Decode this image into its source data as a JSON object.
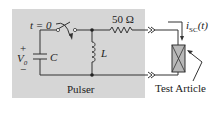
{
  "diagram": {
    "type": "circuit-schematic",
    "colors": {
      "background": "#ffffff",
      "pulser_box": "#d6d6d6",
      "wire": "#333333",
      "test_article_fill": "#b8b8b8"
    },
    "labels": {
      "switch_time": "t = 0",
      "resistor": "50 Ω",
      "voltage_plus": "+",
      "voltage": "V",
      "voltage_sub": "0",
      "voltage_minus": "−",
      "capacitor": "C",
      "inductor": "L",
      "current": "i",
      "current_sub": "SC",
      "current_arg": "(t)",
      "pulser": "Pulser",
      "test_article": "Test Article"
    },
    "components": [
      {
        "id": "C",
        "kind": "capacitor"
      },
      {
        "id": "switch",
        "kind": "switch",
        "closes_at": "t = 0"
      },
      {
        "id": "L",
        "kind": "inductor"
      },
      {
        "id": "R",
        "kind": "resistor",
        "value": "50 Ω"
      },
      {
        "id": "DUT",
        "kind": "test-article"
      }
    ]
  }
}
